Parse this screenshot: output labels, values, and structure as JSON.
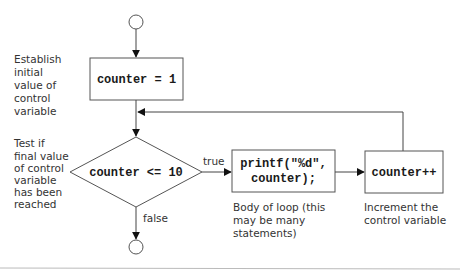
{
  "diagram": {
    "type": "flowchart",
    "nodes": {
      "start": {
        "shape": "circle",
        "label": ""
      },
      "init": {
        "shape": "rectangle",
        "label": "counter = 1"
      },
      "condition": {
        "shape": "diamond",
        "label": "counter <= 10"
      },
      "body": {
        "shape": "rectangle",
        "lines": [
          "printf(\"%d\",",
          "counter);"
        ]
      },
      "increment": {
        "shape": "rectangle",
        "label": "counter++"
      },
      "end": {
        "shape": "circle",
        "label": ""
      }
    },
    "edges": [
      {
        "from": "start",
        "to": "init",
        "label": ""
      },
      {
        "from": "init",
        "to": "condition",
        "label": ""
      },
      {
        "from": "condition",
        "to": "body",
        "label": "true"
      },
      {
        "from": "condition",
        "to": "end",
        "label": "false"
      },
      {
        "from": "body",
        "to": "increment",
        "label": ""
      },
      {
        "from": "increment",
        "to": "condition",
        "label": ""
      }
    ],
    "edge_labels": {
      "true": "true",
      "false": "false"
    },
    "annotations": {
      "init": [
        "Establish",
        "initial",
        "value of",
        "control",
        "variable"
      ],
      "condition": [
        "Test if",
        "final value",
        "of control",
        "variable",
        "has been",
        "reached"
      ],
      "body": [
        "Body of loop (this",
        "may be many",
        "statements)"
      ],
      "increment": [
        "Increment the",
        "control variable"
      ]
    },
    "colors": {
      "stroke": "#555555",
      "text": "#333333",
      "background": "#ffffff"
    }
  }
}
